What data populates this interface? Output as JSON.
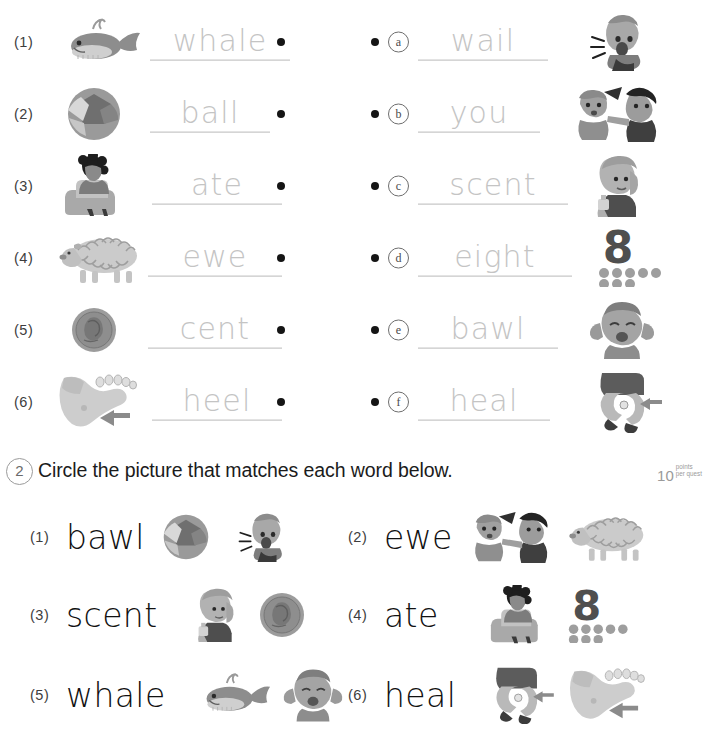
{
  "worksheet": {
    "section1": {
      "left_items": [
        {
          "num": "(1)",
          "word": "whale",
          "picture": "whale-picture"
        },
        {
          "num": "(2)",
          "word": "ball",
          "picture": "ball-picture"
        },
        {
          "num": "(3)",
          "word": "ate",
          "picture": "girl-eating-picture"
        },
        {
          "num": "(4)",
          "word": "ewe",
          "picture": "sheep-picture"
        },
        {
          "num": "(5)",
          "word": "cent",
          "picture": "penny-coin-picture"
        },
        {
          "num": "(6)",
          "word": "heel",
          "picture": "foot-heel-picture"
        }
      ],
      "right_items": [
        {
          "letter": "a",
          "word": "wail",
          "picture": "boy-wailing-picture"
        },
        {
          "letter": "b",
          "word": "you",
          "picture": "boy-pointing-picture"
        },
        {
          "letter": "c",
          "word": "scent",
          "picture": "woman-perfume-picture"
        },
        {
          "letter": "d",
          "word": "eight",
          "picture": "number-eight-picture"
        },
        {
          "letter": "e",
          "word": "bawl",
          "picture": "girl-crying-picture"
        },
        {
          "letter": "f",
          "word": "heal",
          "picture": "knee-bandage-picture"
        }
      ]
    },
    "section2": {
      "number": "2",
      "instruction": "Circle the picture that matches each word below.",
      "points": {
        "value": "10",
        "line1": "points",
        "line2": "per quest"
      },
      "items": [
        {
          "num": "(1)",
          "word": "bawl",
          "choices": [
            "ball-picture",
            "boy-wailing-picture"
          ]
        },
        {
          "num": "(2)",
          "word": "ewe",
          "choices": [
            "boy-pointing-picture",
            "sheep-picture"
          ]
        },
        {
          "num": "(3)",
          "word": "scent",
          "choices": [
            "woman-perfume-picture",
            "penny-coin-picture"
          ]
        },
        {
          "num": "(4)",
          "word": "ate",
          "choices": [
            "girl-eating-picture",
            "number-eight-picture"
          ]
        },
        {
          "num": "(5)",
          "word": "whale",
          "choices": [
            "whale-picture",
            "girl-crying-picture"
          ]
        },
        {
          "num": "(6)",
          "word": "heal",
          "choices": [
            "knee-bandage-picture",
            "foot-heel-picture"
          ]
        }
      ]
    },
    "colors": {
      "trace_gray": "#c4c4c4",
      "ink_black": "#151515",
      "badge_gray": "#9b9b9b"
    }
  }
}
